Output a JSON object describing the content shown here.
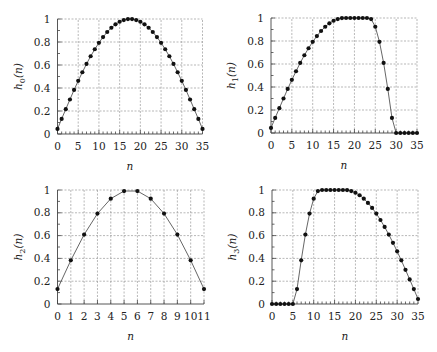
{
  "chart_data": [
    {
      "id": "h0",
      "type": "scatter",
      "title": "",
      "xlabel": "n",
      "ylabel": "h0(n)",
      "ylabel_main": "h",
      "ylabel_sub": "0",
      "ylabel_suffix": "(n)",
      "xlim": [
        0,
        35
      ],
      "ylim": [
        0,
        1
      ],
      "xticks": [
        0,
        5,
        10,
        15,
        20,
        25,
        30,
        35
      ],
      "yticks": [
        0,
        0.2,
        0.4,
        0.6,
        0.8,
        1
      ],
      "ytick_labels": [
        "0",
        "0.2",
        "0.4",
        "0.6",
        "0.8",
        "1"
      ],
      "grid": true,
      "line": true,
      "x": [
        0,
        1,
        2,
        3,
        4,
        5,
        6,
        7,
        8,
        9,
        10,
        11,
        12,
        13,
        14,
        15,
        16,
        17,
        18,
        19,
        20,
        21,
        22,
        23,
        24,
        25,
        26,
        27,
        28,
        29,
        30,
        31,
        32,
        33,
        34,
        35
      ],
      "values": [
        0.044,
        0.131,
        0.216,
        0.3,
        0.383,
        0.462,
        0.537,
        0.609,
        0.676,
        0.737,
        0.793,
        0.843,
        0.887,
        0.924,
        0.954,
        0.976,
        0.991,
        0.999,
        0.999,
        0.991,
        0.976,
        0.954,
        0.924,
        0.887,
        0.843,
        0.793,
        0.737,
        0.676,
        0.609,
        0.537,
        0.462,
        0.383,
        0.3,
        0.216,
        0.131,
        0.044
      ],
      "box": {
        "x0": 57.5,
        "x1": 202.5,
        "y0": 134,
        "y1": 19
      }
    },
    {
      "id": "h1",
      "type": "scatter",
      "title": "",
      "xlabel": "n",
      "ylabel": "h1(n)",
      "ylabel_main": "h",
      "ylabel_sub": "1",
      "ylabel_suffix": "(n)",
      "xlim": [
        0,
        35
      ],
      "ylim": [
        0,
        1
      ],
      "xticks": [
        0,
        5,
        10,
        15,
        20,
        25,
        30,
        35
      ],
      "yticks": [
        0,
        0.2,
        0.4,
        0.6,
        0.8,
        1
      ],
      "ytick_labels": [
        "0",
        "0.2",
        "0.4",
        "0.6",
        "0.8",
        "1"
      ],
      "grid": true,
      "line": true,
      "x": [
        0,
        1,
        2,
        3,
        4,
        5,
        6,
        7,
        8,
        9,
        10,
        11,
        12,
        13,
        14,
        15,
        16,
        17,
        18,
        19,
        20,
        21,
        22,
        23,
        24,
        25,
        26,
        27,
        28,
        29,
        30,
        31,
        32,
        33,
        34,
        35
      ],
      "values": [
        0.044,
        0.131,
        0.216,
        0.3,
        0.383,
        0.462,
        0.537,
        0.609,
        0.676,
        0.737,
        0.793,
        0.843,
        0.887,
        0.924,
        0.954,
        0.976,
        0.991,
        0.999,
        1,
        1,
        1,
        1,
        1,
        1,
        0.991,
        0.924,
        0.793,
        0.609,
        0.383,
        0.131,
        0,
        0,
        0,
        0,
        0,
        0
      ],
      "box": {
        "x0": 271,
        "x1": 417,
        "y0": 133,
        "y1": 18
      }
    },
    {
      "id": "h2",
      "type": "scatter",
      "title": "",
      "xlabel": "n",
      "ylabel": "h2(n)",
      "ylabel_main": "h",
      "ylabel_sub": "2",
      "ylabel_suffix": "(n)",
      "xlim": [
        0,
        11
      ],
      "ylim": [
        0,
        1
      ],
      "xticks": [
        0,
        1,
        2,
        3,
        4,
        5,
        6,
        7,
        8,
        9,
        10,
        11
      ],
      "yticks": [
        0,
        0.2,
        0.4,
        0.6,
        0.8,
        1
      ],
      "ytick_labels": [
        "0",
        "0.2",
        "0.4",
        "0.6",
        "0.8",
        "1"
      ],
      "grid": true,
      "line": true,
      "x": [
        0,
        1,
        2,
        3,
        4,
        5,
        6,
        7,
        8,
        9,
        10,
        11
      ],
      "values": [
        0.131,
        0.383,
        0.609,
        0.793,
        0.924,
        0.991,
        0.991,
        0.924,
        0.793,
        0.609,
        0.383,
        0.131
      ],
      "box": {
        "x0": 57.5,
        "x1": 204,
        "y0": 304,
        "y1": 190
      }
    },
    {
      "id": "h3",
      "type": "scatter",
      "title": "",
      "xlabel": "n",
      "ylabel": "h3(n)",
      "ylabel_main": "h",
      "ylabel_sub": "3",
      "ylabel_suffix": "(n)",
      "xlim": [
        0,
        35
      ],
      "ylim": [
        0,
        1
      ],
      "xticks": [
        0,
        5,
        10,
        15,
        20,
        25,
        30,
        35
      ],
      "yticks": [
        0,
        0.2,
        0.4,
        0.6,
        0.8,
        1
      ],
      "ytick_labels": [
        "0",
        "0.2",
        "0.4",
        "0.6",
        "0.8",
        "1"
      ],
      "grid": true,
      "line": true,
      "x": [
        0,
        1,
        2,
        3,
        4,
        5,
        6,
        7,
        8,
        9,
        10,
        11,
        12,
        13,
        14,
        15,
        16,
        17,
        18,
        19,
        20,
        21,
        22,
        23,
        24,
        25,
        26,
        27,
        28,
        29,
        30,
        31,
        32,
        33,
        34,
        35
      ],
      "values": [
        0,
        0,
        0,
        0,
        0,
        0,
        0.131,
        0.383,
        0.609,
        0.793,
        0.924,
        0.991,
        1,
        1,
        1,
        1,
        1,
        1,
        0.999,
        0.991,
        0.976,
        0.954,
        0.924,
        0.887,
        0.843,
        0.793,
        0.737,
        0.676,
        0.609,
        0.537,
        0.462,
        0.383,
        0.3,
        0.216,
        0.131,
        0.044
      ],
      "box": {
        "x0": 272,
        "x1": 418,
        "y0": 304,
        "y1": 190
      }
    }
  ]
}
